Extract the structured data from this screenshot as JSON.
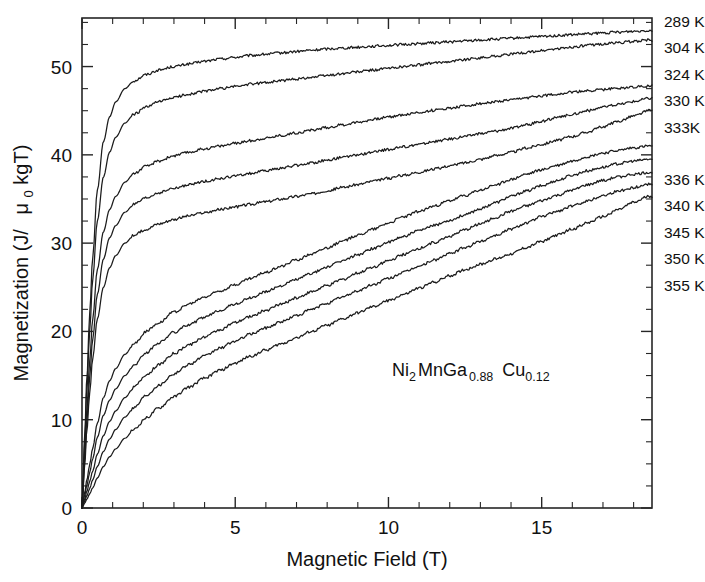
{
  "chart_data": {
    "type": "line",
    "title": "",
    "xlabel": "Magnetic Field (T)",
    "ylabel": "Magnetization (J/ μ₀kgT)",
    "ylabel_parts": {
      "main": "Magnetization (J/",
      "mu": "μ",
      "mu_sub": "0",
      "tail": "kgT)"
    },
    "xlim": [
      0,
      18.6
    ],
    "ylim": [
      0,
      55.5
    ],
    "xticks": [
      0,
      5,
      10,
      15
    ],
    "xticklabels": [
      "0",
      "5",
      "10",
      "15"
    ],
    "x_minor_step": 1,
    "yticks": [
      0,
      10,
      20,
      30,
      40,
      50
    ],
    "yticklabels": [
      "0",
      "10",
      "20",
      "30",
      "40",
      "50"
    ],
    "y_minor_step": 2.5,
    "grid": false,
    "legend_position": "right-outside",
    "line_color": "#1c1c1c",
    "annotation": {
      "text": "Ni2MnGa0.88 Cu0.12",
      "display": {
        "e1": "Ni",
        "s1": "2",
        "e2": "MnGa",
        "s2": "0.88",
        "e3": "Cu",
        "s3": "0.12"
      },
      "x": 9.6,
      "y": 18.6
    },
    "x": [
      0,
      0.08,
      0.16,
      0.25,
      0.35,
      0.5,
      0.7,
      0.9,
      1.1,
      1.4,
      1.7,
      2.1,
      2.5,
      3.0,
      3.5,
      4.0,
      4.5,
      5.0,
      5.5,
      6.0,
      6.5,
      7.0,
      7.5,
      8.0,
      8.5,
      9.0,
      9.5,
      10.0,
      10.5,
      11.0,
      11.5,
      12.0,
      12.5,
      13.0,
      13.5,
      14.0,
      14.5,
      15.0,
      15.5,
      16.0,
      16.5,
      17.0,
      17.5,
      18.0,
      18.5
    ],
    "series": [
      {
        "name": "289 K",
        "label": "289 K",
        "group": "low-temperature",
        "end_value": 54.1,
        "values": [
          0,
          7.5,
          14.8,
          22.0,
          28.5,
          36.0,
          41.5,
          44.3,
          46.0,
          47.5,
          48.4,
          49.1,
          49.6,
          50.0,
          50.3,
          50.6,
          50.85,
          51.05,
          51.25,
          51.4,
          51.55,
          51.7,
          51.85,
          52.0,
          52.1,
          52.2,
          52.3,
          52.4,
          52.5,
          52.6,
          52.7,
          52.8,
          52.9,
          53.0,
          53.1,
          53.2,
          53.3,
          53.4,
          53.5,
          53.6,
          53.7,
          53.8,
          53.9,
          54.0,
          54.1
        ]
      },
      {
        "name": "304 K",
        "label": "304 K",
        "group": "low-temperature",
        "end_value": 53.0,
        "values": [
          0,
          6.8,
          13.5,
          20.0,
          26.0,
          32.5,
          37.5,
          40.3,
          42.0,
          43.6,
          44.6,
          45.4,
          46.0,
          46.5,
          46.9,
          47.2,
          47.5,
          47.75,
          48.0,
          48.2,
          48.4,
          48.6,
          48.8,
          49.0,
          49.2,
          49.4,
          49.6,
          49.8,
          50.0,
          50.2,
          50.4,
          50.6,
          50.8,
          51.0,
          51.2,
          51.4,
          51.6,
          51.8,
          52.0,
          52.2,
          52.4,
          52.55,
          52.7,
          52.85,
          53.0
        ]
      },
      {
        "name": "324 K",
        "label": "324 K",
        "group": "low-temperature",
        "end_value": 47.8,
        "values": [
          0,
          5.6,
          11.2,
          16.6,
          21.5,
          27.0,
          31.3,
          33.8,
          35.3,
          36.9,
          37.9,
          38.7,
          39.3,
          39.9,
          40.3,
          40.7,
          41.0,
          41.3,
          41.6,
          41.9,
          42.2,
          42.5,
          42.8,
          43.1,
          43.4,
          43.7,
          44.0,
          44.3,
          44.55,
          44.8,
          45.05,
          45.3,
          45.55,
          45.8,
          46.0,
          46.2,
          46.45,
          46.7,
          46.9,
          47.1,
          47.25,
          47.4,
          47.55,
          47.7,
          47.8
        ]
      },
      {
        "name": "330 K",
        "label": "330 K",
        "group": "low-temperature",
        "end_value": 46.4,
        "values": [
          0,
          5.0,
          10.0,
          14.8,
          19.2,
          24.2,
          28.2,
          30.6,
          32.0,
          33.5,
          34.4,
          35.1,
          35.7,
          36.2,
          36.6,
          37.0,
          37.3,
          37.6,
          37.9,
          38.2,
          38.5,
          38.8,
          39.1,
          39.4,
          39.7,
          40.0,
          40.3,
          40.6,
          40.9,
          41.2,
          41.5,
          41.8,
          42.1,
          42.4,
          42.7,
          43.0,
          43.4,
          43.8,
          44.2,
          44.6,
          45.0,
          45.4,
          45.7,
          46.05,
          46.4
        ]
      },
      {
        "name": "333K",
        "label": "333K",
        "group": "low-temperature",
        "end_value": 45.0,
        "values": [
          0,
          4.4,
          8.8,
          13.0,
          17.0,
          21.4,
          25.0,
          27.2,
          28.6,
          30.0,
          30.9,
          31.6,
          32.2,
          32.7,
          33.1,
          33.45,
          33.8,
          34.1,
          34.4,
          34.7,
          35.0,
          35.3,
          35.6,
          35.95,
          36.3,
          36.65,
          37.0,
          37.35,
          37.7,
          38.05,
          38.4,
          38.75,
          39.1,
          39.5,
          39.9,
          40.3,
          40.75,
          41.2,
          41.65,
          42.1,
          42.6,
          43.2,
          43.8,
          44.4,
          45.0
        ]
      },
      {
        "name": "336 K",
        "label": "336 K",
        "group": "high-temperature",
        "end_value": 41.0,
        "values": [
          0,
          1.6,
          3.2,
          4.9,
          6.8,
          9.6,
          12.5,
          14.4,
          15.8,
          17.4,
          18.6,
          20.0,
          21.0,
          22.2,
          23.1,
          23.9,
          24.6,
          25.3,
          26.0,
          26.7,
          27.4,
          28.1,
          28.8,
          29.5,
          30.2,
          30.9,
          31.6,
          32.3,
          33.0,
          33.6,
          34.2,
          34.8,
          35.4,
          36.0,
          36.6,
          37.2,
          37.8,
          38.3,
          38.8,
          39.3,
          39.8,
          40.2,
          40.5,
          40.8,
          41.0
        ]
      },
      {
        "name": "340 K",
        "label": "340 K",
        "group": "high-temperature",
        "end_value": 39.5,
        "values": [
          0,
          1.3,
          2.6,
          4.0,
          5.6,
          8.0,
          10.5,
          12.2,
          13.5,
          15.0,
          16.2,
          17.6,
          18.7,
          19.9,
          20.8,
          21.6,
          22.4,
          23.1,
          23.8,
          24.5,
          25.2,
          25.9,
          26.6,
          27.3,
          28.0,
          28.7,
          29.4,
          30.1,
          30.8,
          31.4,
          32.0,
          32.6,
          33.2,
          33.9,
          34.6,
          35.3,
          35.9,
          36.5,
          37.1,
          37.7,
          38.2,
          38.6,
          39.0,
          39.3,
          39.5
        ]
      },
      {
        "name": "345 K",
        "label": "345 K",
        "group": "high-temperature",
        "end_value": 38.0,
        "values": [
          0,
          0.9,
          1.9,
          3.0,
          4.2,
          6.1,
          8.2,
          9.8,
          11.0,
          12.5,
          13.7,
          15.1,
          16.2,
          17.5,
          18.5,
          19.4,
          20.2,
          21.0,
          21.7,
          22.4,
          23.1,
          23.8,
          24.5,
          25.2,
          25.9,
          26.6,
          27.3,
          28.0,
          28.7,
          29.4,
          30.1,
          30.8,
          31.5,
          32.2,
          32.9,
          33.6,
          34.2,
          34.8,
          35.4,
          36.0,
          36.6,
          37.1,
          37.5,
          37.8,
          38.0
        ]
      },
      {
        "name": "350 K",
        "label": "350 K",
        "group": "high-temperature",
        "end_value": 36.7,
        "values": [
          0,
          0.7,
          1.4,
          2.2,
          3.2,
          4.7,
          6.4,
          7.8,
          8.9,
          10.3,
          11.4,
          12.8,
          13.9,
          15.2,
          16.3,
          17.2,
          18.1,
          18.9,
          19.7,
          20.4,
          21.1,
          21.8,
          22.5,
          23.2,
          23.9,
          24.6,
          25.3,
          26.0,
          26.7,
          27.4,
          28.1,
          28.8,
          29.5,
          30.2,
          30.9,
          31.6,
          32.3,
          33.0,
          33.6,
          34.2,
          34.8,
          35.4,
          35.9,
          36.3,
          36.7
        ]
      },
      {
        "name": "355 K",
        "label": "355 K",
        "group": "high-temperature",
        "end_value": 35.3,
        "values": [
          0,
          0.5,
          1.0,
          1.6,
          2.3,
          3.4,
          4.7,
          5.8,
          6.7,
          7.9,
          8.9,
          10.2,
          11.3,
          12.6,
          13.7,
          14.7,
          15.6,
          16.4,
          17.2,
          17.9,
          18.6,
          19.3,
          20.0,
          20.7,
          21.4,
          22.1,
          22.8,
          23.5,
          24.2,
          24.9,
          25.6,
          26.3,
          27.0,
          27.6,
          28.2,
          28.8,
          29.5,
          30.2,
          30.9,
          31.6,
          32.3,
          33.0,
          33.8,
          34.6,
          35.3
        ]
      }
    ],
    "legend_entries": [
      {
        "label": "289 K",
        "y_at_right": 54.1
      },
      {
        "label": "304 K",
        "y_at_right": 53.0
      },
      {
        "label": "324 K",
        "y_at_right": 47.8
      },
      {
        "label": "330 K",
        "y_at_right": 46.4
      },
      {
        "label": "333K",
        "y_at_right": 45.0
      },
      {
        "label": "336 K",
        "y_at_right": 41.0
      },
      {
        "label": "340 K",
        "y_at_right": 39.5
      },
      {
        "label": "345 K",
        "y_at_right": 38.0
      },
      {
        "label": "350 K",
        "y_at_right": 36.7
      },
      {
        "label": "355 K",
        "y_at_right": 35.3
      }
    ]
  }
}
